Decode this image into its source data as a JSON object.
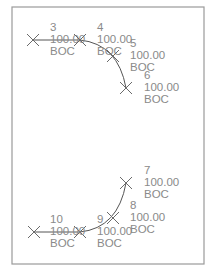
{
  "drawing": {
    "frame": {
      "x": 12,
      "y": 7,
      "w": 192,
      "h": 257,
      "color": "#9a9a9a"
    },
    "colors": {
      "label": "#8a8a8a",
      "line": "#555555",
      "marker": "#6a6a6a"
    },
    "points": [
      {
        "id": "3",
        "value": "100.00",
        "code": "BOC",
        "mx": 33,
        "my": 40,
        "tx": 50,
        "ty": 31
      },
      {
        "id": "4",
        "value": "100.00",
        "code": "BOC",
        "mx": 80,
        "my": 40,
        "tx": 97,
        "ty": 31
      },
      {
        "id": "5",
        "value": "100.00",
        "code": "BOC",
        "mx": 113,
        "my": 56,
        "tx": 130,
        "ty": 47
      },
      {
        "id": "6",
        "value": "100.00",
        "code": "BOC",
        "mx": 126,
        "my": 88,
        "tx": 144,
        "ty": 79
      },
      {
        "id": "7",
        "value": "100.00",
        "code": "BOC",
        "mx": 126,
        "my": 183,
        "tx": 144,
        "ty": 174
      },
      {
        "id": "8",
        "value": "100.00",
        "code": "BOC",
        "mx": 113,
        "my": 218,
        "tx": 130,
        "ty": 209
      },
      {
        "id": "9",
        "value": "100.00",
        "code": "BOC",
        "mx": 80,
        "my": 232,
        "tx": 97,
        "ty": 223
      },
      {
        "id": "10",
        "value": "100.00",
        "code": "BOC",
        "mx": 34,
        "my": 232,
        "tx": 50,
        "ty": 223
      }
    ]
  }
}
